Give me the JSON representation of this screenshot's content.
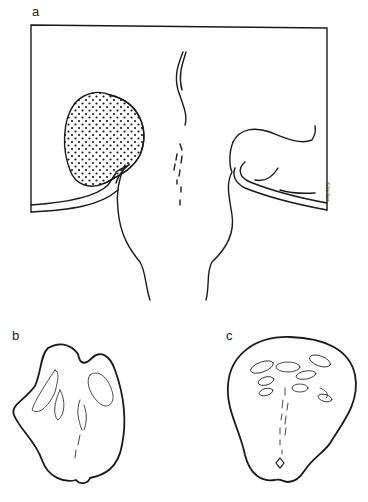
{
  "figure": {
    "panels": [
      {
        "id": "a",
        "label": "a"
      },
      {
        "id": "b",
        "label": "b"
      },
      {
        "id": "c",
        "label": "c"
      }
    ],
    "signature": "Sänchez",
    "colors": {
      "ink": "#1a1a1a",
      "background": "#ffffff"
    }
  }
}
